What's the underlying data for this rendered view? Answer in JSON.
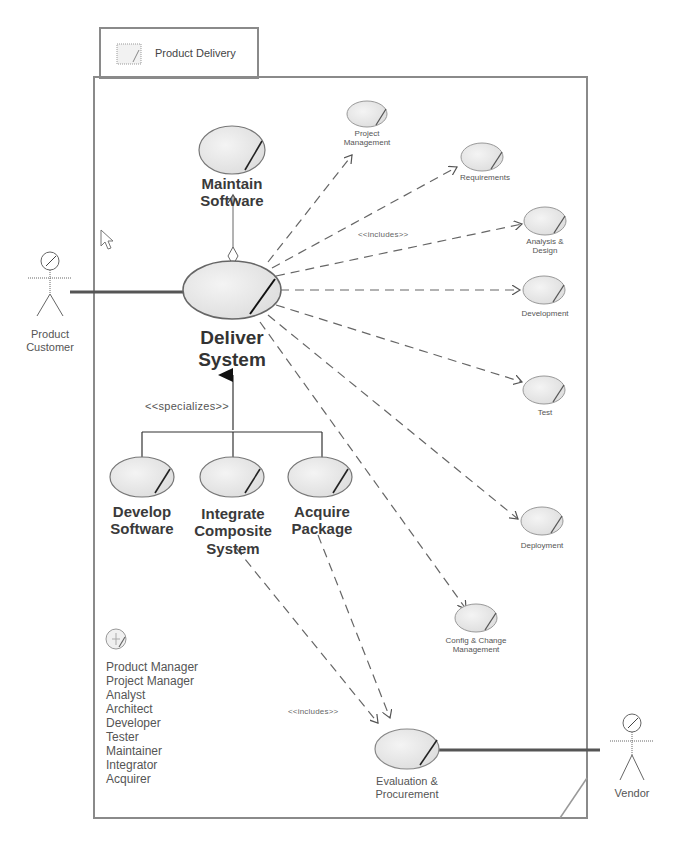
{
  "package": {
    "title": "Product Delivery",
    "icon": "package-folder-icon"
  },
  "actors": [
    {
      "id": "product-customer",
      "label": "Product\nCustomer",
      "line1": "Product",
      "line2": "Customer"
    },
    {
      "id": "vendor",
      "label": "Vendor"
    }
  ],
  "use_cases": {
    "maintain_software": {
      "line1": "Maintain",
      "line2": "Software"
    },
    "deliver_system": {
      "line1": "Deliver",
      "line2": "System"
    },
    "develop_software": {
      "line1": "Develop",
      "line2": "Software"
    },
    "integrate_composite_system": {
      "line1": "Integrate",
      "line2": "Composite",
      "line3": "System"
    },
    "acquire_package": {
      "line1": "Acquire",
      "line2": "Package"
    },
    "project_management": {
      "line1": "Project",
      "line2": "Management"
    },
    "requirements": {
      "line1": "Requirements"
    },
    "analysis_design": {
      "line1": "Analysis &",
      "line2": "Design"
    },
    "development": {
      "line1": "Development"
    },
    "test": {
      "line1": "Test"
    },
    "deployment": {
      "line1": "Deployment"
    },
    "config_change": {
      "line1": "Config & Change",
      "line2": "Management"
    },
    "evaluation_procurement": {
      "line1": "Evaluation &",
      "line2": "Procurement"
    }
  },
  "stereotypes": {
    "includes_top": "<<includes>>",
    "specializes": "<<specializes>>",
    "includes_bottom": "<<includes>>"
  },
  "roles": {
    "icon": "worker-role-icon",
    "items": [
      "Product Manager",
      "Project Manager",
      "Analyst",
      "Architect",
      "Developer",
      "Tester",
      "Maintainer",
      "Integrator",
      "Acquirer"
    ]
  },
  "colors": {
    "frame": "#8a8a8a",
    "ellipse_fill": "#ececec",
    "ellipse_stroke": "#777777",
    "association": "#555555",
    "dashed": "#666666"
  }
}
